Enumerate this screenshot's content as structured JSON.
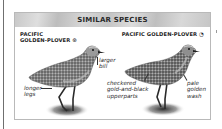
{
  "panel": {
    "title": "SIMILAR SPECIES"
  },
  "species": [
    {
      "name_line1": "PACIFIC",
      "name_line2": "GOLDEN-PLOVER",
      "symbol": "⊛",
      "symbol_icon": "breeding-plumage-icon",
      "annotations": [
        {
          "line1": "larger",
          "line2": "bill"
        },
        {
          "line1": "longer",
          "line2": "legs"
        }
      ]
    },
    {
      "name_line1": "PACIFIC GOLDEN-PLOVER",
      "symbol": "◔",
      "symbol_icon": "nonbreeding-plumage-icon",
      "annotations": [
        {
          "line1": "checkered",
          "line2": "gold-and-black",
          "line3": "upperparts"
        },
        {
          "line1": "pale",
          "line2": "golden",
          "line3": "wash"
        }
      ]
    }
  ],
  "colors": {
    "header_gray": "#c8c8c8",
    "border_gray": "#b9b9b9",
    "text_dark": "#1e1e1e"
  }
}
